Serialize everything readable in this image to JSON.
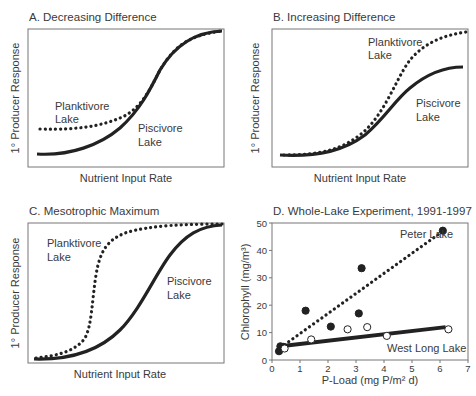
{
  "panels": {
    "a": {
      "title": "A. Decreasing Difference",
      "xlabel": "Nutrient Input Rate",
      "ylabel": "1° Producer Response",
      "label_plank_1": "Planktivore",
      "label_plank_2": "Lake",
      "label_pisc_1": "Piscivore",
      "label_pisc_2": "Lake"
    },
    "b": {
      "title": "B. Increasing Difference",
      "xlabel": "Nutrient Input Rate",
      "ylabel": "1° Producer Response",
      "label_plank_1": "Planktivore",
      "label_plank_2": "Lake",
      "label_pisc_1": "Piscivore",
      "label_pisc_2": "Lake"
    },
    "c": {
      "title": "C. Mesotrophic Maximum",
      "xlabel": "Nutrient Input Rate",
      "ylabel": "1° Producer Response",
      "label_plank_1": "Planktivore",
      "label_plank_2": "Lake",
      "label_pisc_1": "Piscivore",
      "label_pisc_2": "Lake"
    },
    "d": {
      "title": "D. Whole-Lake Experiment, 1991-1997",
      "xlabel": "P-Load (mg P/m² d)",
      "ylabel": "Chlorophyll (mg/m³)",
      "label_peter": "Peter Lake",
      "label_west": "West Long Lake",
      "xticks": [
        "0",
        "1",
        "2",
        "3",
        "4",
        "5",
        "6",
        "7"
      ],
      "yticks": [
        "0",
        "10",
        "20",
        "30",
        "40",
        "50"
      ]
    }
  },
  "chart_data": [
    {
      "type": "line",
      "title": "A. Decreasing Difference",
      "xlabel": "Nutrient Input Rate",
      "ylabel": "1° Producer Response",
      "series": [
        {
          "name": "Planktivore Lake",
          "style": "dotted",
          "x": [
            0,
            0.2,
            0.4,
            0.55,
            0.7,
            0.85,
            1.0
          ],
          "values": [
            0.27,
            0.29,
            0.36,
            0.52,
            0.77,
            0.94,
            1.0
          ]
        },
        {
          "name": "Piscivore Lake",
          "style": "solid",
          "x": [
            0,
            0.2,
            0.4,
            0.55,
            0.7,
            0.85,
            1.0
          ],
          "values": [
            0.08,
            0.11,
            0.24,
            0.41,
            0.7,
            0.92,
            1.0
          ]
        }
      ]
    },
    {
      "type": "line",
      "title": "B. Increasing Difference",
      "xlabel": "Nutrient Input Rate",
      "ylabel": "1° Producer Response",
      "series": [
        {
          "name": "Planktivore Lake",
          "style": "dotted",
          "x": [
            0,
            0.2,
            0.4,
            0.55,
            0.7,
            0.85,
            1.0
          ],
          "values": [
            0.08,
            0.1,
            0.22,
            0.5,
            0.8,
            0.92,
            0.98
          ]
        },
        {
          "name": "Piscivore Lake",
          "style": "solid",
          "x": [
            0,
            0.2,
            0.4,
            0.55,
            0.7,
            0.85,
            1.0
          ],
          "values": [
            0.08,
            0.09,
            0.2,
            0.39,
            0.6,
            0.71,
            0.75
          ]
        }
      ]
    },
    {
      "type": "line",
      "title": "C. Mesotrophic Maximum",
      "xlabel": "Nutrient Input Rate",
      "ylabel": "1° Producer Response",
      "series": [
        {
          "name": "Planktivore Lake",
          "style": "dotted",
          "x": [
            0,
            0.15,
            0.3,
            0.35,
            0.42,
            0.55,
            0.75,
            1.0
          ],
          "values": [
            0.03,
            0.1,
            0.35,
            0.62,
            0.85,
            0.95,
            0.99,
            1.0
          ]
        },
        {
          "name": "Piscivore Lake",
          "style": "solid",
          "x": [
            0,
            0.2,
            0.4,
            0.6,
            0.75,
            0.9,
            1.0
          ],
          "values": [
            0.02,
            0.06,
            0.22,
            0.56,
            0.83,
            0.96,
            1.0
          ]
        }
      ]
    },
    {
      "type": "scatter",
      "title": "D. Whole-Lake Experiment, 1991-1997",
      "xlabel": "P-Load (mg P/m² d)",
      "ylabel": "Chlorophyll (mg/m³)",
      "xlim": [
        0,
        7
      ],
      "ylim": [
        0,
        50
      ],
      "series": [
        {
          "name": "Peter Lake",
          "marker": "filled",
          "fit": "dotted",
          "fit_line": [
            [
              0.3,
              4.5
            ],
            [
              6.1,
              47
            ]
          ],
          "points": [
            [
              0.25,
              3.2
            ],
            [
              0.3,
              5
            ],
            [
              0.4,
              4.8
            ],
            [
              1.2,
              18
            ],
            [
              2.1,
              12.2
            ],
            [
              3.1,
              17
            ],
            [
              3.2,
              33.5
            ],
            [
              6.1,
              47.2
            ]
          ]
        },
        {
          "name": "West Long Lake",
          "marker": "open",
          "fit": "solid",
          "fit_line": [
            [
              0.3,
              5
            ],
            [
              6.2,
              12
            ]
          ],
          "points": [
            [
              0.45,
              4.2
            ],
            [
              1.4,
              7.5
            ],
            [
              2.7,
              11.2
            ],
            [
              3.4,
              12
            ],
            [
              4.1,
              8.8
            ],
            [
              6.3,
              11.2
            ]
          ]
        }
      ]
    }
  ]
}
